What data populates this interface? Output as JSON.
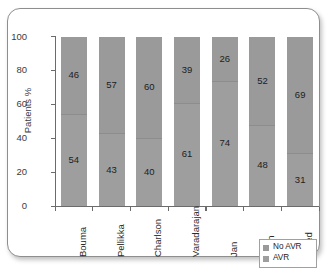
{
  "chart_data": {
    "type": "bar",
    "subtype": "stacked-percentage",
    "title": "",
    "xlabel": "",
    "ylabel": "Patients %",
    "ylim": [
      0,
      100
    ],
    "yticks": [
      0,
      20,
      40,
      60,
      80,
      100
    ],
    "ytick_labels": [
      "0",
      "20",
      "40",
      "60",
      "80",
      "100"
    ],
    "grid": false,
    "legend_position": "bottom-right",
    "categories": [
      "Bouma",
      "Pellikka",
      "Charlson",
      "Varadarajan",
      "Jan",
      "Bach",
      "Freed"
    ],
    "series": [
      {
        "name": "No AVR",
        "color": "#9a9a9a",
        "values": [
          46,
          57,
          60,
          39,
          26,
          52,
          69
        ]
      },
      {
        "name": "AVR",
        "color": "#9e9e9e",
        "values": [
          54,
          43,
          40,
          61,
          74,
          48,
          31
        ]
      }
    ]
  },
  "legend": {
    "items": [
      {
        "label": "No AVR",
        "color": "#9a9a9a"
      },
      {
        "label": "AVR",
        "color": "#9e9e9e"
      }
    ]
  },
  "colors": {
    "frame_border": "#8e8e8e",
    "axis": "#6b6b6b",
    "background": "#ffffff",
    "text": "#2a2a2a"
  }
}
